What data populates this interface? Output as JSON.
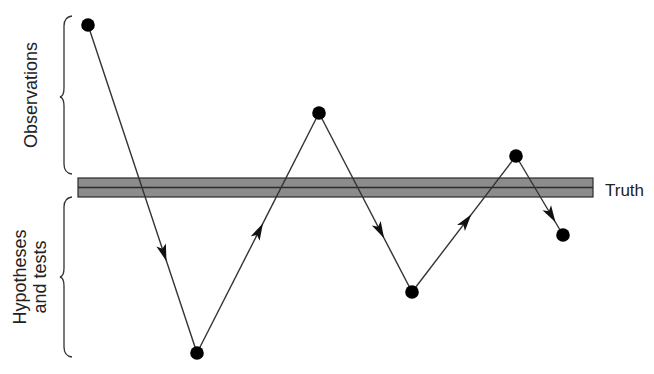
{
  "diagram": {
    "title": "",
    "labels": {
      "observations": "Observations",
      "hypotheses_line1": "Hypotheses",
      "hypotheses_line2": "and tests",
      "truth": "Truth"
    },
    "colors": {
      "line": "#333333",
      "point": "#000000",
      "truth_band_fill": "#8c8c8c",
      "truth_band_stroke": "#2a2a2a",
      "text": "#222222",
      "background": "#ffffff"
    },
    "truth_band": {
      "x1": 78,
      "x2": 593,
      "y_top": 178,
      "y_bottom": 197,
      "y_mid": 187
    },
    "points": [
      {
        "id": "p1",
        "x": 88,
        "y": 25,
        "region": "observations"
      },
      {
        "id": "p2",
        "x": 197,
        "y": 353,
        "region": "hypotheses"
      },
      {
        "id": "p3",
        "x": 319,
        "y": 113,
        "region": "observations"
      },
      {
        "id": "p4",
        "x": 412,
        "y": 292,
        "region": "hypotheses"
      },
      {
        "id": "p5",
        "x": 516,
        "y": 156,
        "region": "observations"
      },
      {
        "id": "p6",
        "x": 563,
        "y": 235,
        "region": "hypotheses"
      }
    ],
    "edges": [
      {
        "from": "p1",
        "to": "p2",
        "arrow_at": 0.72
      },
      {
        "from": "p2",
        "to": "p3",
        "arrow_at": 0.54
      },
      {
        "from": "p3",
        "to": "p4",
        "arrow_at": 0.7
      },
      {
        "from": "p4",
        "to": "p5",
        "arrow_at": 0.57
      },
      {
        "from": "p5",
        "to": "p6",
        "arrow_at": 0.84
      }
    ],
    "braces": [
      {
        "id": "observations-brace",
        "x": 66,
        "y_top": 16,
        "y_bottom": 173,
        "tip_y": 97
      },
      {
        "id": "hypotheses-brace",
        "x": 66,
        "y_top": 197,
        "y_bottom": 356,
        "tip_y": 277
      }
    ]
  }
}
